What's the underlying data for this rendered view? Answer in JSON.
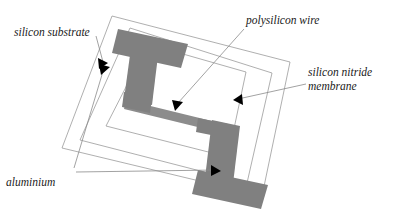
{
  "figure": {
    "background_color": "#ffffff",
    "metal_fill_color": "#808080",
    "wire_fill_color": "#8c8c8c",
    "frame_stroke_color": "#9a9a9a",
    "leader_stroke_color": "#8a8a8a",
    "arrow_fill_color": "#000000",
    "label_text_color": "#1a1a1a"
  },
  "labels": {
    "silicon_substrate": "silicon substrate",
    "polysilicon_wire": "polysilicon wire",
    "silicon_nitride_line1": "silicon nitride",
    "silicon_nitride_line2": "membrane",
    "aluminium": "aluminium"
  },
  "geometry": {
    "outer_frame_points": "112,16 290,62 262,196 62,148",
    "middle_frame_points": "130,28 272,73 247,183 80,140",
    "inner_frame_points": "148,44 246,72 228,157 106,126",
    "aluminium_top_pad": "118,29 188,44 181,68 112,53",
    "aluminium_left_bar": "133,33 160,39 152,105 124,99",
    "aluminium_left_foot": "124,92 152,98 150,113 122,107",
    "aluminium_right_bar": "212,120 240,126 232,192 204,186",
    "aluminium_bottom_pad": "198,170 268,185 261,209 192,194",
    "aluminium_right_shoulder": "198,118 228,124 226,138 196,132",
    "polysilicon_wire_path": "126,100 220,123 218,132 124,109"
  },
  "leaders": [
    {
      "name": "silicon-substrate-leader",
      "path": "M 96,36 L 103,62",
      "arrow_points": "98,58 108,63 99,69"
    },
    {
      "name": "polysilicon-wire-leader",
      "path": "M 244,29 L 178,103",
      "arrow_points": "172,100 183,102 175,111"
    },
    {
      "name": "silicon-nitride-leader",
      "path": "M 306,84 L 238,99",
      "arrow_points": "242,94 233,100 243,105"
    },
    {
      "name": "aluminium-leader-left",
      "path": "M 74,168 L 104,68",
      "arrow_points": "99,64 110,67 101,75"
    },
    {
      "name": "aluminium-leader-right",
      "path": "M 76,172 L 216,170",
      "arrow_points": "211,165 221,171 211,176"
    }
  ],
  "label_positions": {
    "silicon_substrate": {
      "x": 14,
      "y": 36
    },
    "polysilicon_wire": {
      "x": 246,
      "y": 24
    },
    "silicon_nitride_line1": {
      "x": 308,
      "y": 76
    },
    "silicon_nitride_line2": {
      "x": 308,
      "y": 90
    },
    "aluminium": {
      "x": 6,
      "y": 186
    }
  }
}
